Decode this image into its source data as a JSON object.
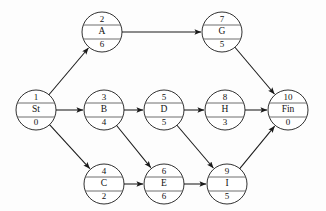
{
  "diagram": {
    "type": "project-network",
    "geometry": {
      "width": 326,
      "height": 211,
      "node_radius": 20,
      "row_y_top": 32,
      "row_y_mid": 110,
      "row_y_bottom": 184
    },
    "colors": {
      "background": "#fdfdfd",
      "node_fill": "#ffffff",
      "node_stroke": "#1a1a1a",
      "divider_stroke": "#4a4a4a",
      "edge_stroke": "#1a1a1a",
      "text": "#111111"
    },
    "nodes": [
      {
        "id": "n1",
        "number": "1",
        "label": "St",
        "duration": "0",
        "cx": 36,
        "cy": 110
      },
      {
        "id": "n2",
        "number": "2",
        "label": "A",
        "duration": "6",
        "cx": 102,
        "cy": 32
      },
      {
        "id": "n3",
        "number": "3",
        "label": "B",
        "duration": "4",
        "cx": 104,
        "cy": 110
      },
      {
        "id": "n4",
        "number": "4",
        "label": "C",
        "duration": "2",
        "cx": 104,
        "cy": 184
      },
      {
        "id": "n5",
        "number": "5",
        "label": "D",
        "duration": "5",
        "cx": 164,
        "cy": 110
      },
      {
        "id": "n6",
        "number": "6",
        "label": "E",
        "duration": "6",
        "cx": 164,
        "cy": 184
      },
      {
        "id": "n7",
        "number": "7",
        "label": "G",
        "duration": "5",
        "cx": 222,
        "cy": 32
      },
      {
        "id": "n8",
        "number": "8",
        "label": "H",
        "duration": "3",
        "cx": 225,
        "cy": 110
      },
      {
        "id": "n9",
        "number": "9",
        "label": "I",
        "duration": "5",
        "cx": 227,
        "cy": 184
      },
      {
        "id": "n10",
        "number": "10",
        "label": "Fin",
        "duration": "0",
        "cx": 288,
        "cy": 110
      }
    ],
    "edges": [
      {
        "id": "e1",
        "from": "n1",
        "to": "n2"
      },
      {
        "id": "e2",
        "from": "n1",
        "to": "n3"
      },
      {
        "id": "e3",
        "from": "n1",
        "to": "n4"
      },
      {
        "id": "e4",
        "from": "n2",
        "to": "n7"
      },
      {
        "id": "e5",
        "from": "n3",
        "to": "n5"
      },
      {
        "id": "e6",
        "from": "n3",
        "to": "n6"
      },
      {
        "id": "e7",
        "from": "n4",
        "to": "n6"
      },
      {
        "id": "e8",
        "from": "n5",
        "to": "n8"
      },
      {
        "id": "e9",
        "from": "n5",
        "to": "n9"
      },
      {
        "id": "e10",
        "from": "n6",
        "to": "n9"
      },
      {
        "id": "e11",
        "from": "n7",
        "to": "n10"
      },
      {
        "id": "e12",
        "from": "n8",
        "to": "n10"
      },
      {
        "id": "e13",
        "from": "n9",
        "to": "n10"
      }
    ]
  }
}
